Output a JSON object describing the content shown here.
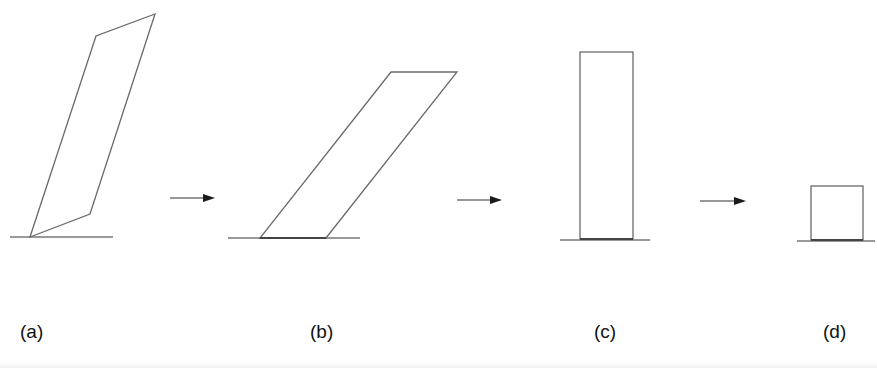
{
  "figure": {
    "panels": [
      {
        "id": "a",
        "label": "(a)",
        "shape": "parallelogram-tall-tilted"
      },
      {
        "id": "b",
        "label": "(b)",
        "shape": "parallelogram-sheared"
      },
      {
        "id": "c",
        "label": "(c)",
        "shape": "tall-rectangle"
      },
      {
        "id": "d",
        "label": "(d)",
        "shape": "square"
      }
    ],
    "arrows": [
      "arrow-right",
      "arrow-right",
      "arrow-right"
    ],
    "colors": {
      "stroke": "#6a6a6a",
      "arrow": "#1a1a1a",
      "text": "#111111",
      "background": "#ffffff"
    }
  }
}
